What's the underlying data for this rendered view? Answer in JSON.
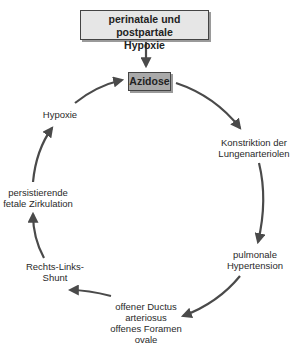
{
  "diagram": {
    "title_box": {
      "line1": "perinatale und postpartale",
      "line2": "Hypoxie",
      "fill": "#e6e6e6"
    },
    "center_box": {
      "label": "Azidose",
      "fill": "#a9a9a9"
    },
    "cycle_nodes": [
      {
        "id": "konstriktion",
        "line1": "Konstriktion der",
        "line2": "Lungenarteriolen"
      },
      {
        "id": "hypertension",
        "line1": "pulmonale",
        "line2": "Hypertension"
      },
      {
        "id": "ductus",
        "line1": "offener Ductus",
        "line2": "arteriosus",
        "line3": "offenes Foramen",
        "line4": "ovale"
      },
      {
        "id": "shunt",
        "line1": "Rechts-Links-",
        "line2": "Shunt"
      },
      {
        "id": "zirkulation",
        "line1": "persistierende",
        "line2": "fetale Zirkulation"
      },
      {
        "id": "hypoxie",
        "line1": "Hypoxie"
      }
    ],
    "edges": [
      {
        "from": "perinatale und postpartale Hypoxie",
        "to": "Azidose"
      },
      {
        "from": "Azidose",
        "to": "Konstriktion der Lungenarteriolen"
      },
      {
        "from": "Konstriktion der Lungenarteriolen",
        "to": "pulmonale Hypertension"
      },
      {
        "from": "pulmonale Hypertension",
        "to": "offener Ductus arteriosus offenes Foramen ovale"
      },
      {
        "from": "offener Ductus arteriosus offenes Foramen ovale",
        "to": "Rechts-Links-Shunt"
      },
      {
        "from": "Rechts-Links-Shunt",
        "to": "persistierende fetale Zirkulation"
      },
      {
        "from": "persistierende fetale Zirkulation",
        "to": "Hypoxie"
      },
      {
        "from": "Hypoxie",
        "to": "Azidose"
      }
    ],
    "arrow_color": "#4a4a4a"
  }
}
